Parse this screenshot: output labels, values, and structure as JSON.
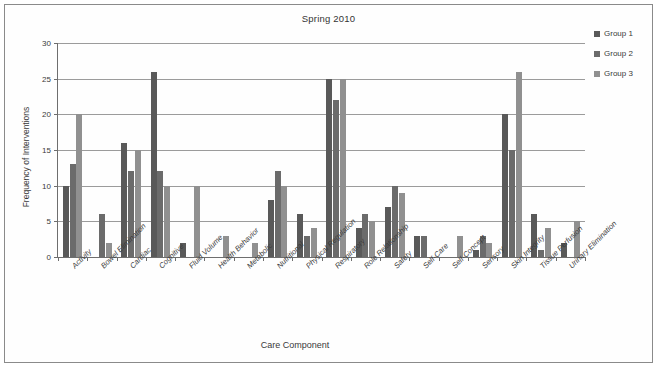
{
  "figure": {
    "title": "Spring 2010",
    "xlabel": "Care Component",
    "ylabel": "Frequency of Interventions"
  },
  "legend": {
    "position": "top-right",
    "entries": [
      {
        "label": "Group 1",
        "color": "#595959"
      },
      {
        "label": "Group 2",
        "color": "#6b6b6b"
      },
      {
        "label": "Group 3",
        "color": "#909090"
      }
    ]
  },
  "axis": {
    "y_ticks": [
      "0",
      "5",
      "10",
      "15",
      "20",
      "25",
      "30"
    ],
    "y_min": 0,
    "y_max": 30,
    "grid": true
  },
  "chart_data": {
    "type": "bar",
    "title": "Spring 2010",
    "xlabel": "Care Component",
    "ylabel": "Frequency of Interventions",
    "ylim": [
      0,
      30
    ],
    "ytick_step": 5,
    "grid": true,
    "legend_position": "top-right",
    "categories": [
      "Activity",
      "Bowel Elimination",
      "Cardiac",
      "Cognitive",
      "Fluid Volume",
      "Health Behavior",
      "Metabolic",
      "Nutritional",
      "Physical Regulation",
      "Respiratory",
      "Role Relationship",
      "Safety",
      "Self-Care",
      "Self-Concept",
      "Sensory",
      "Skin Integrity",
      "Tissue Perfusion",
      "Urinary Elimination"
    ],
    "series": [
      {
        "name": "Group 1",
        "color": "#595959",
        "values": [
          10,
          0,
          16,
          26,
          2,
          0,
          0,
          8,
          6,
          25,
          4,
          7,
          3,
          0,
          1,
          20,
          6,
          2
        ]
      },
      {
        "name": "Group 2",
        "color": "#6b6b6b",
        "values": [
          13,
          6,
          12,
          12,
          0,
          0,
          0,
          12,
          3,
          22,
          6,
          10,
          3,
          0,
          3,
          15,
          1,
          0
        ]
      },
      {
        "name": "Group 3",
        "color": "#909090",
        "values": [
          20,
          2,
          15,
          10,
          10,
          3,
          2,
          10,
          4,
          25,
          5,
          9,
          0,
          3,
          2,
          26,
          4,
          5
        ]
      }
    ]
  }
}
